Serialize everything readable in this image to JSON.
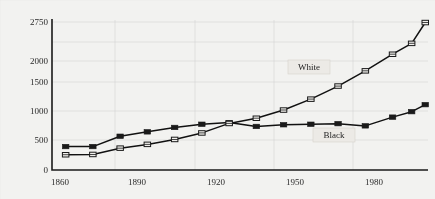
{
  "chart_data": {
    "type": "line",
    "title": "",
    "xlabel": "",
    "ylabel": "",
    "xlim": [
      1860,
      1998
    ],
    "ylim": [
      0,
      2750
    ],
    "grid": true,
    "legend_position": "inline-annotations",
    "x_ticks": [
      "1860",
      "1890",
      "1920",
      "1950",
      "1980"
    ],
    "x_tick_values": [
      1860,
      1890,
      1920,
      1950,
      1980
    ],
    "y_ticks": [
      "0",
      "500",
      "1000",
      "1500",
      "2000",
      "2750"
    ],
    "y_tick_values": [
      0,
      500,
      1000,
      1500,
      2000,
      2750
    ],
    "series": [
      {
        "name": "Black",
        "marker": "filled-square",
        "x": [
          1865,
          1875,
          1885,
          1895,
          1905,
          1915,
          1925,
          1935,
          1945,
          1955,
          1965,
          1975,
          1985,
          1992,
          1997
        ],
        "values": [
          430,
          430,
          620,
          700,
          780,
          840,
          870,
          800,
          830,
          840,
          850,
          810,
          970,
          1070,
          1200
        ]
      },
      {
        "name": "White",
        "marker": "open-square",
        "x": [
          1865,
          1875,
          1885,
          1895,
          1905,
          1915,
          1925,
          1935,
          1945,
          1955,
          1965,
          1975,
          1985,
          1992,
          1997
        ],
        "values": [
          280,
          285,
          400,
          470,
          560,
          680,
          855,
          950,
          1100,
          1300,
          1540,
          1820,
          2130,
          2340,
          2740
        ]
      }
    ],
    "annotations": [
      {
        "text": "White",
        "x": 1958,
        "y": 1900
      },
      {
        "text": "Black",
        "x": 1975,
        "y": 700
      }
    ]
  }
}
